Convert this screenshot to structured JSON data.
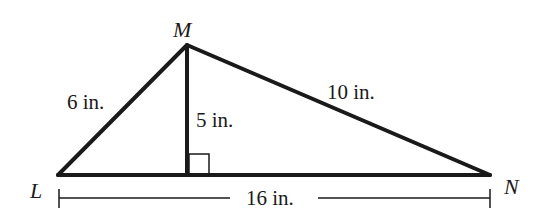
{
  "diagram": {
    "type": "triangle-with-altitude",
    "colors": {
      "stroke": "#1a1a1a",
      "background": "#ffffff"
    },
    "vertices": {
      "M": {
        "label": "M",
        "x": 187,
        "y": 45
      },
      "L": {
        "label": "L",
        "x": 58,
        "y": 175
      },
      "N": {
        "label": "N",
        "x": 490,
        "y": 175
      },
      "foot": {
        "x": 187,
        "y": 175
      }
    },
    "measurements": {
      "LM": "6 in.",
      "MN": "10 in.",
      "altitude": "5 in.",
      "LN": "16 in."
    },
    "right_angle_marker": true
  }
}
